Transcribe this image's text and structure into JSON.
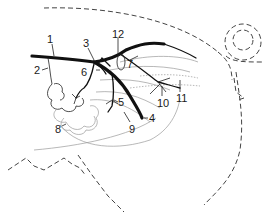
{
  "figure": {
    "type": "anatomical line drawing",
    "labels": [
      {
        "id": "1",
        "text": "1"
      },
      {
        "id": "2",
        "text": "2"
      },
      {
        "id": "3",
        "text": "3"
      },
      {
        "id": "4",
        "text": "4"
      },
      {
        "id": "5",
        "text": "5"
      },
      {
        "id": "6",
        "text": "6"
      },
      {
        "id": "7",
        "text": "7"
      },
      {
        "id": "8",
        "text": "8"
      },
      {
        "id": "9",
        "text": "9"
      },
      {
        "id": "10",
        "text": "10"
      },
      {
        "id": "11",
        "text": "11"
      },
      {
        "id": "12",
        "text": "12"
      }
    ],
    "colors": {
      "line": "#111111",
      "faint": "#9a9a9a",
      "background": "#ffffff"
    }
  }
}
